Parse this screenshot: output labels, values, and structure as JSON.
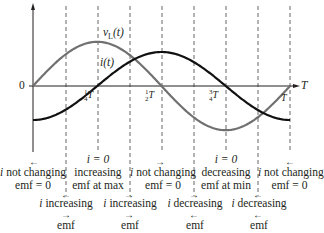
{
  "figure": {
    "origin_label": "0",
    "t_axis_label": "T",
    "curve_labels": {
      "vl": "v",
      "vl_sub": "L",
      "vl_arg": "(t)",
      "i": "i(t)"
    },
    "tick_labels": [
      {
        "num": "1",
        "den": "4",
        "suffix": "T"
      },
      {
        "num": "1",
        "den": "2",
        "suffix": "T"
      },
      {
        "num": "3",
        "den": "4",
        "suffix": "T"
      },
      {
        "num": "",
        "den": "",
        "suffix": "T"
      }
    ],
    "colors": {
      "i_curve": "#111111",
      "vl_curve": "#707070",
      "dashed": "#555555",
      "axis": "#231f20"
    }
  },
  "annotations": {
    "row1": [
      {
        "line1": "i",
        "line1b": " not changing",
        "line2": "emf = 0",
        "arrow": "←"
      },
      {
        "line0": "i = 0",
        "line1": "increasing",
        "line2": "emf at max"
      },
      {
        "line1": "i",
        "line1b": " not changing",
        "line2": "emf = 0",
        "arrow": "→"
      },
      {
        "line0": "i = 0",
        "line1": "decreasing",
        "line2": "emf at min"
      },
      {
        "line1": "i",
        "line1b": " not changing",
        "line2": "emf = 0",
        "arrow": "←"
      }
    ],
    "row2": [
      {
        "i": "i",
        "text": " increasing",
        "emf": "emf",
        "i_arrow": "←",
        "emf_arrow": "→"
      },
      {
        "i": "i",
        "text": " increasing",
        "emf": "emf",
        "i_arrow": "→",
        "emf_arrow": "→"
      },
      {
        "i": "i",
        "text": " decreasing",
        "emf": "emf",
        "i_arrow": "→",
        "emf_arrow": "←"
      },
      {
        "i": "i",
        "text": " decreasing",
        "emf": "emf",
        "i_arrow": "←",
        "emf_arrow": "←"
      }
    ]
  },
  "chart_data": {
    "type": "line",
    "title": "",
    "xlabel": "T",
    "ylabel": "",
    "x_ticks": [
      "0",
      "1/4 T",
      "1/2 T",
      "3/4 T",
      "T"
    ],
    "series": [
      {
        "name": "v_L(t)",
        "function": "sin(2πt/T)",
        "amplitude": 1.3,
        "x": [
          0,
          0.25,
          0.5,
          0.75,
          1.0
        ],
        "values": [
          0,
          1.3,
          0,
          -1.3,
          0
        ]
      },
      {
        "name": "i(t)",
        "function": "-cos(2πt/T)",
        "amplitude": 1.0,
        "x": [
          0,
          0.25,
          0.5,
          0.75,
          1.0
        ],
        "values": [
          -1,
          0,
          1,
          0,
          -1
        ]
      }
    ],
    "grid": "vertical dashed lines every T/8",
    "xlim": [
      0,
      1
    ]
  }
}
